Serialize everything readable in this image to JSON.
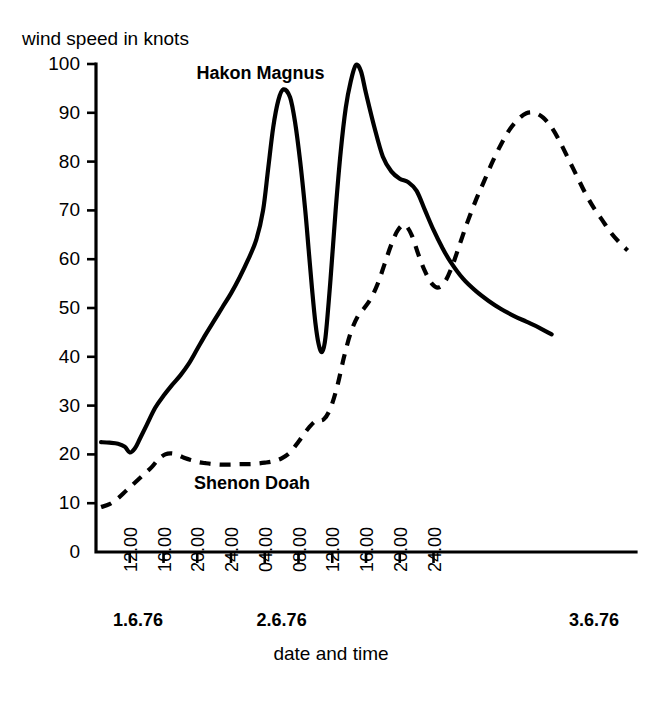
{
  "chart_data": {
    "type": "line",
    "title": "",
    "xlabel": "date and time",
    "ylabel": "wind speed in knots",
    "ylim": [
      0,
      100
    ],
    "yticks": [
      0,
      10,
      20,
      30,
      40,
      50,
      60,
      70,
      80,
      90,
      100
    ],
    "xlim": [
      8,
      72
    ],
    "xticks": [
      12,
      16,
      20,
      24,
      28,
      32,
      36,
      40,
      44,
      48
    ],
    "xticklabels": [
      "12.00",
      "16.00",
      "20.00",
      "24.00",
      "04.00",
      "08.00",
      "12.00",
      "16.00",
      "20.00",
      "24.00"
    ],
    "grid": false,
    "legend_position": "inline-annotation",
    "date_labels": [
      {
        "text": "1.6.76",
        "hour": 10
      },
      {
        "text": "2.6.76",
        "hour": 30
      },
      {
        "text": "3.6.76",
        "hour": 70
      }
    ],
    "annotations": [
      {
        "text": "Hakon Magnus",
        "hour": 27.5,
        "value": 97
      },
      {
        "text": "Shenon Doah",
        "hour": 26.5,
        "value": 13
      }
    ],
    "series": [
      {
        "name": "Hakon Magnus",
        "style": "solid",
        "color": "#000000",
        "x": [
          8.6,
          9.6,
          10.6,
          11.4,
          12.0,
          12.6,
          13.2,
          14.0,
          15.0,
          16.0,
          17.0,
          18.0,
          19.0,
          20.0,
          21.0,
          22.0,
          23.0,
          24.0,
          25.0,
          26.0,
          27.0,
          27.8,
          28.4,
          29.0,
          29.6,
          30.2,
          31.0,
          31.6,
          32.2,
          32.8,
          33.2,
          33.6,
          34.0,
          34.4,
          34.8,
          35.2,
          35.8,
          36.4,
          37.0,
          37.6,
          38.2,
          38.8,
          39.4,
          40.0,
          41.0,
          42.0,
          43.0,
          44.0,
          45.0,
          46.0,
          47.0,
          48.0,
          49.0,
          50.0,
          51.5,
          53.0,
          54.5,
          56.0,
          57.5,
          59.0,
          60.5,
          62.0
        ],
        "y": [
          22.5,
          22.4,
          22.2,
          21.6,
          20.4,
          21.2,
          23.2,
          26.0,
          29.5,
          32.0,
          34.2,
          36.2,
          38.6,
          41.6,
          44.6,
          47.4,
          50.2,
          53.0,
          56.2,
          59.8,
          64.0,
          70.0,
          78.5,
          87.0,
          92.5,
          94.8,
          93.2,
          88.0,
          80.0,
          70.0,
          62.0,
          54.0,
          47.0,
          42.5,
          41.0,
          44.0,
          56.0,
          70.0,
          82.0,
          91.0,
          96.5,
          99.8,
          98.5,
          94.0,
          87.0,
          81.0,
          78.0,
          76.5,
          75.8,
          74.0,
          70.0,
          66.0,
          62.5,
          59.5,
          56.0,
          53.5,
          51.5,
          49.8,
          48.4,
          47.2,
          46.0,
          44.6
        ]
      },
      {
        "name": "Shenon Doah",
        "style": "dashed",
        "color": "#000000",
        "x": [
          8.6,
          9.6,
          10.6,
          11.6,
          12.6,
          13.6,
          14.6,
          15.4,
          16.2,
          17.0,
          17.8,
          18.6,
          19.4,
          20.2,
          21.0,
          22.0,
          23.0,
          24.0,
          25.0,
          26.0,
          27.0,
          28.0,
          29.0,
          30.0,
          31.0,
          32.0,
          33.0,
          34.0,
          35.0,
          35.8,
          36.6,
          37.4,
          38.2,
          39.0,
          39.8,
          40.6,
          41.4,
          42.2,
          43.0,
          43.8,
          44.6,
          45.4,
          46.2,
          47.0,
          47.8,
          48.6,
          49.4,
          50.2,
          51.0,
          52.0,
          53.0,
          54.0,
          55.0,
          56.0,
          57.0,
          58.0,
          59.0,
          60.0,
          61.0,
          62.0,
          63.0,
          64.0,
          65.0,
          66.0,
          67.0,
          68.0,
          69.0,
          70.0,
          71.0
        ],
        "y": [
          9.2,
          9.8,
          11.0,
          12.6,
          14.2,
          15.8,
          17.4,
          19.0,
          20.0,
          20.2,
          19.8,
          19.2,
          18.8,
          18.4,
          18.2,
          18.0,
          17.9,
          17.9,
          18.0,
          18.0,
          18.1,
          18.3,
          18.6,
          19.2,
          20.4,
          22.6,
          25.0,
          26.8,
          27.2,
          29.5,
          34.0,
          40.0,
          45.0,
          48.2,
          50.0,
          52.0,
          55.0,
          59.0,
          63.0,
          66.0,
          67.0,
          65.0,
          61.0,
          57.5,
          55.0,
          54.2,
          55.5,
          58.5,
          62.5,
          67.5,
          72.0,
          76.0,
          80.0,
          83.5,
          86.5,
          88.6,
          89.9,
          90.0,
          89.0,
          87.0,
          84.0,
          80.5,
          77.0,
          73.5,
          70.5,
          68.0,
          65.5,
          63.5,
          61.8
        ]
      }
    ]
  }
}
